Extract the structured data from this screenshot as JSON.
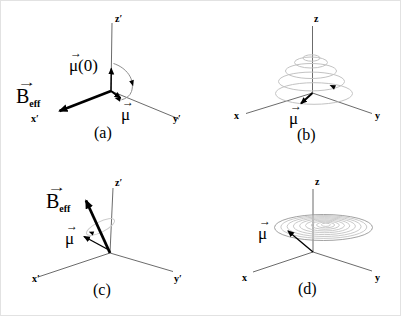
{
  "colors": {
    "background": "#ffffff",
    "axis": "#5a5a5a",
    "vector": "#000000",
    "trajectory": "#c3c3c3",
    "trajectory_dark": "#979797",
    "arc": "#8e8e8e",
    "cone_ring": "#cccccc"
  },
  "panels": {
    "a": {
      "caption": "(a)",
      "axes": {
        "vertical": "z′",
        "left": "x′",
        "right": "y′"
      },
      "labels": {
        "beff": {
          "hat": "→",
          "symbol": "B",
          "subscript": "eff"
        },
        "mu0": {
          "hat": "→",
          "symbol": "μ(0)"
        },
        "mu": {
          "hat": "→",
          "symbol": "μ"
        }
      }
    },
    "b": {
      "caption": "(b)",
      "axes": {
        "vertical": "z",
        "left": "x",
        "right": "y"
      },
      "labels": {
        "mu": {
          "hat": "→",
          "symbol": "μ"
        }
      }
    },
    "c": {
      "caption": "(c)",
      "axes": {
        "vertical": "z′",
        "left": "x′",
        "right": "y′"
      },
      "labels": {
        "beff": {
          "hat": "→",
          "symbol": "B",
          "subscript": "eff"
        },
        "mu": {
          "hat": "→",
          "symbol": "μ"
        }
      }
    },
    "d": {
      "caption": "(d)",
      "axes": {
        "vertical": "z",
        "left": "x",
        "right": "y"
      },
      "labels": {
        "mu": {
          "hat": "→",
          "symbol": "μ"
        }
      }
    }
  }
}
